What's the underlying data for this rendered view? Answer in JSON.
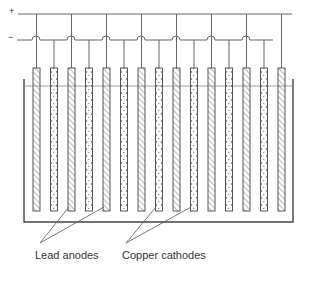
{
  "diagram": {
    "terminals": {
      "positive": "+",
      "negative": "−"
    },
    "labels": {
      "anodes": "Lead anodes",
      "cathodes": "Copper cathodes"
    },
    "electrode_count": 15,
    "electrode_pattern": [
      "anode",
      "cathode",
      "anode",
      "cathode",
      "anode",
      "cathode",
      "anode",
      "cathode",
      "anode",
      "cathode",
      "anode",
      "cathode",
      "anode",
      "cathode",
      "anode"
    ],
    "colors": {
      "line": "#555555",
      "hatch": "#888888",
      "dots": "#555555",
      "background": "#ffffff"
    }
  }
}
